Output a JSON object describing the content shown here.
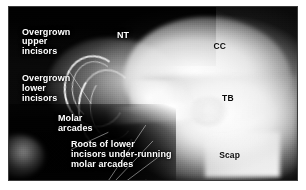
{
  "figure": {
    "kind": "annotated-lateral-skull-radiograph",
    "border_color": "#3a3a3a",
    "background_color": "#ffffff"
  },
  "callouts": [
    {
      "id": "overgrown-upper-incisors",
      "text": "Overgrown\nupper\nincisors",
      "color": "#ffffff",
      "left_pct": 4.5,
      "top_pct": 12.0
    },
    {
      "id": "overgrown-lower-incisors",
      "text": "Overgrown\nlower\nincisors",
      "color": "#ffffff",
      "left_pct": 4.5,
      "top_pct": 39.0
    },
    {
      "id": "molar-arcades",
      "text": "Molar\narcades",
      "color": "#ffffff",
      "left_pct": 17.0,
      "top_pct": 62.0
    },
    {
      "id": "roots-of-lower-incisors",
      "text": "Roots of lower\nincisors under-running\nmolar arcades",
      "color": "#ffffff",
      "left_pct": 21.5,
      "top_pct": 77.0
    }
  ],
  "abbreviations": [
    {
      "id": "nt",
      "text": "NT",
      "color": "#ffffff",
      "left_pct": 37.5,
      "top_pct": 14.0
    },
    {
      "id": "cc",
      "text": "CC",
      "color": "#0b0b0b",
      "left_pct": 71.0,
      "top_pct": 20.0
    },
    {
      "id": "tb",
      "text": "TB",
      "color": "#0b0b0b",
      "left_pct": 74.0,
      "top_pct": 50.0
    },
    {
      "id": "scap",
      "text": "Scap",
      "color": "#0b0b0b",
      "left_pct": 73.0,
      "top_pct": 83.0
    }
  ],
  "leader_lines": [
    {
      "id": "leader-upper-incisors",
      "x1": 21.0,
      "y1": 22.5,
      "x2": 28.5,
      "y2": 33.5
    },
    {
      "id": "leader-lower-incisors",
      "x1": 21.5,
      "y1": 49.5,
      "x2": 34.5,
      "y2": 43.5
    },
    {
      "id": "leader-molar-a",
      "x1": 32.0,
      "y1": 64.0,
      "x2": 47.5,
      "y2": 41.0
    },
    {
      "id": "leader-molar-b",
      "x1": 32.0,
      "y1": 65.5,
      "x2": 50.0,
      "y2": 46.5
    },
    {
      "id": "leader-molar-c",
      "x1": 32.0,
      "y1": 67.0,
      "x2": 52.0,
      "y2": 52.0
    },
    {
      "id": "leader-roots",
      "x1": 42.0,
      "y1": 75.0,
      "x2": 47.5,
      "y2": 60.0
    },
    {
      "id": "leader-scap",
      "x1": 71.5,
      "y1": 84.5,
      "x2": 66.0,
      "y2": 81.0
    }
  ]
}
